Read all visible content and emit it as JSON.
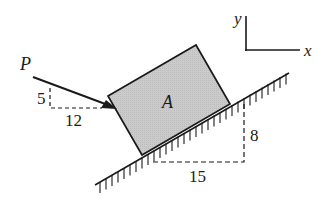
{
  "diagram": {
    "type": "statics-free-body",
    "block": {
      "label": "A",
      "fill": "#c8c8c8"
    },
    "force": {
      "label": "P",
      "slope_rise": "5",
      "slope_run": "12"
    },
    "incline": {
      "slope_rise": "8",
      "slope_run": "15"
    },
    "axes": {
      "x_label": "x",
      "y_label": "y"
    },
    "colors": {
      "ink": "#1a1a1a",
      "block_fill": "#c8c8c8",
      "background": "#ffffff"
    }
  }
}
